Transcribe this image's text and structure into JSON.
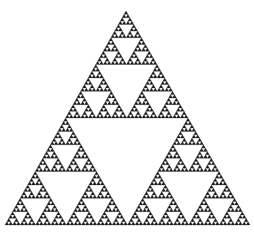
{
  "diagram": {
    "type": "sierpinski-triangle",
    "vertices": {
      "apex": [
        126,
        11
      ],
      "bottom_left": [
        5,
        225
      ],
      "bottom_right": [
        250,
        225
      ]
    },
    "depth": 6,
    "fill_color": "#1a1a1a",
    "background_color": "#ffffff",
    "stroke_color": "#2a2a2a"
  }
}
